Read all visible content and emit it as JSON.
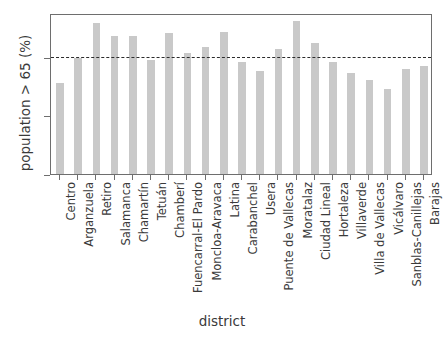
{
  "chart_data": {
    "type": "bar",
    "title": "",
    "xlabel": "district",
    "ylabel": "population > 65 (%)",
    "categories": [
      "Centro",
      "Arganzuela",
      "Retiro",
      "Salamanca",
      "Chamartín",
      "Tetuán",
      "Chamberí",
      "Fuencarral-El Pardo",
      "Moncloa-Aravaca",
      "Latina",
      "Carabanchel",
      "Usera",
      "Puente de Vallecas",
      "Moratalaz",
      "Ciudad Lineal",
      "Hortaleza",
      "Villaverde",
      "Villa de Vallecas",
      "Vicálvaro",
      "Sanblas-Canillejas",
      "Barajas"
    ],
    "values": [
      15.6,
      19.8,
      25.8,
      23.6,
      23.5,
      19.4,
      24.1,
      20.6,
      21.7,
      24.2,
      19.2,
      17.6,
      21.3,
      26.2,
      22.4,
      19.1,
      17.3,
      16.1,
      14.6,
      18.0,
      18.4
    ],
    "ylim": [
      0,
      27.5
    ],
    "yticks": [
      0,
      10,
      20
    ],
    "ytick_labels": [
      "0",
      "10",
      "20"
    ],
    "grid": false,
    "legend": "none",
    "bar_color": "#c9c9c9",
    "annotations": [
      {
        "name": "average-in-madrid",
        "text_line1": "average",
        "text_line2": "in Madrid",
        "value": 20.3,
        "style": "dashed-horizontal-line",
        "color": "#2b2b2b"
      }
    ]
  },
  "axes": {
    "frame_color": "#6e6e6e"
  }
}
